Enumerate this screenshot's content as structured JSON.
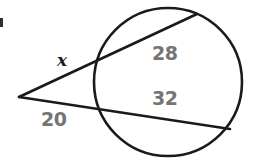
{
  "figure": {
    "kind": "circle-secant-diagram",
    "width": 257,
    "height": 163,
    "background_color": "#ffffff",
    "stroke_color": "#1a1a1a",
    "label_color": "#757575",
    "variable_color": "#1a1a1a"
  },
  "labels": {
    "segment_x": "x",
    "segment_20": "20",
    "segment_28": "28",
    "segment_32": "32"
  },
  "geometry": {
    "circle": {
      "cx": 168,
      "cy": 82,
      "r": 74
    },
    "external_point": {
      "x": 19,
      "y": 97
    },
    "upper_secant": {
      "near_intersection": {
        "x": 96,
        "y": 63
      },
      "far_intersection": {
        "x": 197,
        "y": 14
      }
    },
    "lower_secant": {
      "near_intersection": {
        "x": 100,
        "y": 110
      },
      "far_intersection": {
        "x": 230,
        "y": 129
      }
    }
  }
}
